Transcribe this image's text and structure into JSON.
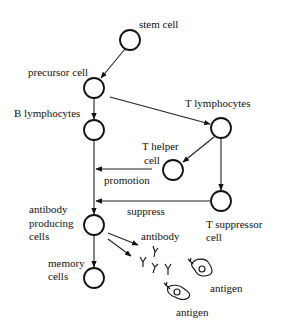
{
  "diagram": {
    "colors": {
      "ink": "#111111",
      "background": "#ffffff"
    },
    "nodes": [
      {
        "id": "stem",
        "label_lines": [
          "stem cell"
        ],
        "cx": 130,
        "cy": 40
      },
      {
        "id": "precursor",
        "label_lines": [
          "precursor cell"
        ],
        "cx": 94,
        "cy": 88
      },
      {
        "id": "b_lymph",
        "label_lines": [
          "B lymphocytes"
        ],
        "cx": 94,
        "cy": 130
      },
      {
        "id": "t_lymph",
        "label_lines": [
          "T lymphocytes"
        ],
        "cx": 221,
        "cy": 128
      },
      {
        "id": "t_helper",
        "label_lines": [
          "T helper",
          "cell"
        ],
        "cx": 173,
        "cy": 170
      },
      {
        "id": "t_suppressor",
        "label_lines": [
          "T suppressor",
          "cell"
        ],
        "cx": 221,
        "cy": 201
      },
      {
        "id": "antibody_producing",
        "label_lines": [
          "antibody",
          "producing",
          "cells"
        ],
        "cx": 94,
        "cy": 225
      },
      {
        "id": "memory",
        "label_lines": [
          "memory",
          "cells"
        ],
        "cx": 94,
        "cy": 278
      }
    ],
    "edges": [
      {
        "from": "stem",
        "to": "precursor",
        "label": ""
      },
      {
        "from": "precursor",
        "to": "b_lymph",
        "label": ""
      },
      {
        "from": "precursor",
        "to": "t_lymph",
        "label": ""
      },
      {
        "from": "t_lymph",
        "to": "t_helper",
        "label": ""
      },
      {
        "from": "t_lymph",
        "to": "t_suppressor",
        "label": ""
      },
      {
        "from": "b_lymph",
        "to": "antibody_producing",
        "label": ""
      },
      {
        "from": "t_helper",
        "to": "b_line",
        "label": "promotion"
      },
      {
        "from": "t_suppressor",
        "to": "b_line",
        "label": "suppress"
      },
      {
        "from": "antibody_producing",
        "to": "memory",
        "label": ""
      },
      {
        "from": "antibody_producing",
        "to": "antibodies",
        "label": ""
      }
    ],
    "labels": {
      "stem": "stem cell",
      "precursor": "precursor cell",
      "b_lymph": "B lymphocytes",
      "t_lymph": "T lymphocytes",
      "t_helper_1": "T helper",
      "t_helper_2": "cell",
      "promotion": "promotion",
      "suppress": "suppress",
      "t_supp_1": "T suppressor",
      "t_supp_2": "cell",
      "abp_1": "antibody",
      "abp_2": "producing",
      "abp_3": "cells",
      "memory_1": "memory",
      "memory_2": "cells",
      "antibody": "antibody",
      "antigen_1": "antigen",
      "antigen_2": "antigen"
    },
    "icons": [
      "antibody-y-icon",
      "antigen-cell-icon"
    ]
  }
}
